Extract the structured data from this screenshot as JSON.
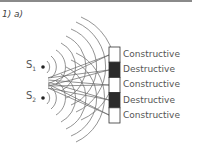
{
  "question_label": "1) a)",
  "sources": [
    {
      "label": "S",
      "subscript": "1"
    },
    {
      "label": "S",
      "subscript": "2"
    }
  ],
  "screen_bands": [
    {
      "type": "constructive",
      "label": "Constructive",
      "color": "#ffffff"
    },
    {
      "type": "destructive",
      "label": "Destructive",
      "color": "#2b2b2b"
    },
    {
      "type": "constructive",
      "label": "Constructive",
      "color": "#ffffff"
    },
    {
      "type": "destructive",
      "label": "Destructive",
      "color": "#2b2b2b"
    },
    {
      "type": "constructive",
      "label": "Constructive",
      "color": "#ffffff"
    }
  ]
}
